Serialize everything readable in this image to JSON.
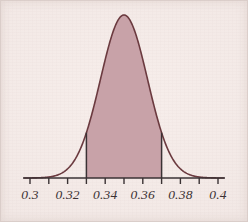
{
  "figure": {
    "kind": "statistical-density-plot",
    "title": "",
    "background_color": "#f3eae7"
  },
  "chart_data": {
    "type": "area",
    "title": "",
    "subtitle": "",
    "xlabel": "",
    "ylabel": "",
    "xlim": [
      0.295,
      0.405
    ],
    "ylim": [
      0,
      1.05
    ],
    "grid": false,
    "legend": null,
    "legend_position": "none",
    "distribution": {
      "name": "normal",
      "mean": 0.35,
      "std_dev": 0.0125,
      "peak_x": 0.35,
      "peak_y": 1.0
    },
    "shaded_region": {
      "label": "",
      "lower_bound": 0.33,
      "upper_bound": 0.37,
      "fill_color": "#c8a2a8",
      "boundary_line_color": "#3a3234"
    },
    "curve": {
      "stroke_color": "#6b3a3f",
      "stroke_width": 1.6
    },
    "axis": {
      "color": "#3a3234",
      "line_width": 1.4,
      "x_start": 0.3,
      "x_end": 0.4,
      "tick_interval": 0.01,
      "tick_length": 6,
      "major_tick_interval": 0.02
    },
    "x_ticks": [
      0.3,
      0.31,
      0.32,
      0.33,
      0.34,
      0.35,
      0.36,
      0.37,
      0.38,
      0.39,
      0.4
    ],
    "x_tick_labels": [
      "0.3",
      "",
      "0.32",
      "",
      "0.34",
      "",
      "0.36",
      "",
      "0.38",
      "",
      "0.4"
    ],
    "labeled_ticks": [
      {
        "value": 0.3,
        "label": "0.3"
      },
      {
        "value": 0.32,
        "label": "0.32"
      },
      {
        "value": 0.34,
        "label": "0.34"
      },
      {
        "value": 0.36,
        "label": "0.36"
      },
      {
        "value": 0.38,
        "label": "0.38"
      },
      {
        "value": 0.4,
        "label": "0.4"
      }
    ],
    "x": [
      0.3,
      0.305,
      0.31,
      0.315,
      0.32,
      0.325,
      0.33,
      0.335,
      0.34,
      0.345,
      0.35,
      0.355,
      0.36,
      0.365,
      0.37,
      0.375,
      0.38,
      0.385,
      0.39,
      0.395,
      0.4
    ],
    "values": [
      0.0,
      0.001,
      0.004,
      0.017,
      0.055,
      0.148,
      0.329,
      0.604,
      0.852,
      0.992,
      1.0,
      0.992,
      0.852,
      0.604,
      0.329,
      0.148,
      0.055,
      0.017,
      0.004,
      0.001,
      0.0
    ]
  }
}
